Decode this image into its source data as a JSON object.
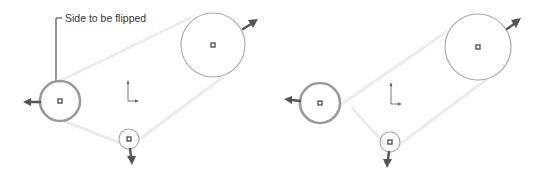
{
  "annotation": {
    "label": "Side to be flipped"
  },
  "colors": {
    "belt": "#ececec",
    "pulley_outline": "#a8a8a8",
    "selected_pulley_outline": "#9a9a9a",
    "direction_arrow": "#555555",
    "leader_line": "#333333"
  },
  "panels": [
    {
      "name": "before-flip",
      "pulleys": [
        {
          "name": "left-pulley",
          "selected": true,
          "arrow_direction": "left"
        },
        {
          "name": "top-right-pulley",
          "selected": false,
          "arrow_direction": "up-right"
        },
        {
          "name": "bottom-pulley",
          "selected": false,
          "arrow_direction": "down"
        }
      ],
      "belt_crossed": false
    },
    {
      "name": "after-flip",
      "pulleys": [
        {
          "name": "left-pulley",
          "selected": true,
          "arrow_direction": "left"
        },
        {
          "name": "top-right-pulley",
          "selected": false,
          "arrow_direction": "up-right"
        },
        {
          "name": "bottom-pulley",
          "selected": false,
          "arrow_direction": "down"
        }
      ],
      "belt_crossed": true
    }
  ]
}
